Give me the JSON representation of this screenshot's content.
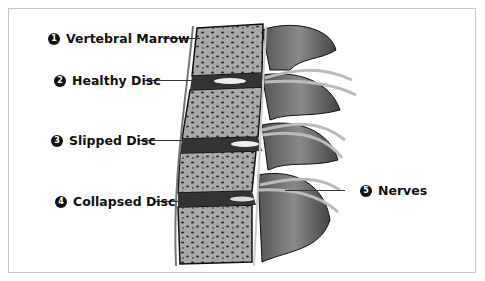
{
  "diagram": {
    "labels": [
      {
        "number": "1",
        "text": "Vertebral Marrow"
      },
      {
        "number": "2",
        "text": "Healthy Disc"
      },
      {
        "number": "3",
        "text": "Slipped Disc"
      },
      {
        "number": "4",
        "text": "Collapsed Disc"
      },
      {
        "number": "5",
        "text": "Nerves"
      }
    ]
  }
}
